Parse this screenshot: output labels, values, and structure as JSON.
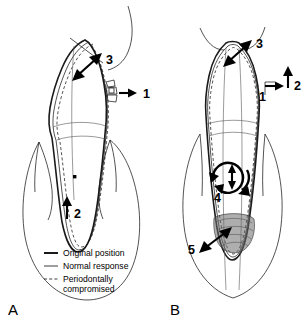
{
  "figure": {
    "background_color": "#ffffff",
    "line_color": "#1a1a1a"
  },
  "panels": [
    {
      "id": "A",
      "letter": "A",
      "description": "Tipping of tooth with normal periodontal support showing centre of rotation",
      "center_of_rotation_marker": "centre-of-rotation-dot",
      "callouts": [
        {
          "number": "1",
          "type": "force-arrow",
          "direction": "horizontal-right",
          "meaning": "applied force at bracket"
        },
        {
          "number": "2",
          "type": "force-arrow",
          "direction": "vertical-up",
          "meaning": "root apex movement"
        },
        {
          "number": "3",
          "type": "double-arrow",
          "direction": "diagonal",
          "meaning": "crown displacement at gingival margin"
        }
      ],
      "attachment": "orthodontic-bracket"
    },
    {
      "id": "B",
      "letter": "B",
      "description": "Tipping of periodontally compromised tooth with apical centre of rotation and bone loss",
      "callouts": [
        {
          "number": "1",
          "type": "force-arrow",
          "direction": "horizontal-right",
          "meaning": "applied force"
        },
        {
          "number": "2",
          "type": "force-arrow",
          "direction": "vertical-up",
          "meaning": "extrusive component"
        },
        {
          "number": "3",
          "type": "double-arrow",
          "direction": "diagonal",
          "meaning": "crown displacement at gingival margin"
        },
        {
          "number": "4",
          "type": "rotation-arrow",
          "direction": "circular-with-vertical-double-arrow",
          "meaning": "apically displaced centre of rotation"
        },
        {
          "number": "5",
          "type": "double-arrow",
          "direction": "diagonal",
          "meaning": "stress concentration in reduced alveolar bone"
        }
      ],
      "bone_region": "stippled-alveolar-bone-crest"
    }
  ],
  "legend": {
    "items": [
      {
        "style": "thick-solid",
        "label": "Original position"
      },
      {
        "style": "thin-solid",
        "label": "Normal response"
      },
      {
        "style": "dashed",
        "label": "Periodontally"
      },
      {
        "style": "continuation",
        "label": "compromised"
      }
    ]
  }
}
